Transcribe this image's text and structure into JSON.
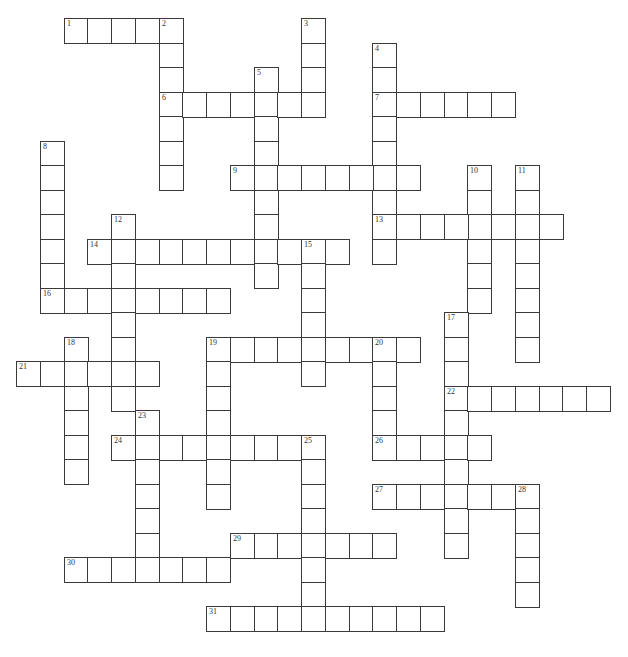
{
  "puzzle": {
    "type": "crossword",
    "layout": {
      "origin_x": 16,
      "origin_y": 18,
      "cell_w": 23.75,
      "cell_h": 24.5
    },
    "colors": {
      "border": "#3a3a3a",
      "fill": "#ffffff",
      "number": "#333333"
    },
    "entries": [
      {
        "number": "1",
        "dir": "across",
        "row": 0,
        "col": 2,
        "length": 5
      },
      {
        "number": "2",
        "dir": "down",
        "row": 0,
        "col": 6,
        "length": 7
      },
      {
        "number": "3",
        "dir": "down",
        "row": 0,
        "col": 12,
        "length": 4
      },
      {
        "number": "4",
        "dir": "down",
        "row": 1,
        "col": 15,
        "length": 9
      },
      {
        "number": "5",
        "dir": "down",
        "row": 2,
        "col": 10,
        "length": 9
      },
      {
        "number": "6",
        "dir": "across",
        "row": 3,
        "col": 6,
        "length": 7
      },
      {
        "number": "7",
        "dir": "across",
        "row": 3,
        "col": 15,
        "length": 6
      },
      {
        "number": "8",
        "dir": "down",
        "row": 5,
        "col": 1,
        "length": 7
      },
      {
        "number": "9",
        "dir": "across",
        "row": 6,
        "col": 9,
        "length": 8
      },
      {
        "number": "10",
        "dir": "down",
        "row": 6,
        "col": 19,
        "length": 6
      },
      {
        "number": "11",
        "dir": "down",
        "row": 6,
        "col": 21,
        "length": 8
      },
      {
        "number": "12",
        "dir": "down",
        "row": 8,
        "col": 4,
        "length": 8
      },
      {
        "number": "13",
        "dir": "across",
        "row": 8,
        "col": 15,
        "length": 8
      },
      {
        "number": "14",
        "dir": "across",
        "row": 9,
        "col": 3,
        "length": 11
      },
      {
        "number": "15",
        "dir": "down",
        "row": 9,
        "col": 12,
        "length": 6
      },
      {
        "number": "16",
        "dir": "across",
        "row": 11,
        "col": 1,
        "length": 8
      },
      {
        "number": "17",
        "dir": "down",
        "row": 12,
        "col": 18,
        "length": 10
      },
      {
        "number": "18",
        "dir": "down",
        "row": 13,
        "col": 2,
        "length": 6
      },
      {
        "number": "19",
        "dir": "across",
        "row": 13,
        "col": 8,
        "length": 9
      },
      {
        "number": "19",
        "dir": "down",
        "row": 13,
        "col": 8,
        "length": 7
      },
      {
        "number": "20",
        "dir": "down",
        "row": 13,
        "col": 15,
        "length": 5
      },
      {
        "number": "21",
        "dir": "across",
        "row": 14,
        "col": 0,
        "length": 6
      },
      {
        "number": "22",
        "dir": "across",
        "row": 15,
        "col": 18,
        "length": 7
      },
      {
        "number": "23",
        "dir": "down",
        "row": 16,
        "col": 5,
        "length": 7
      },
      {
        "number": "24",
        "dir": "across",
        "row": 17,
        "col": 4,
        "length": 9
      },
      {
        "number": "25",
        "dir": "down",
        "row": 17,
        "col": 12,
        "length": 8
      },
      {
        "number": "26",
        "dir": "across",
        "row": 17,
        "col": 15,
        "length": 5
      },
      {
        "number": "27",
        "dir": "across",
        "row": 19,
        "col": 15,
        "length": 7
      },
      {
        "number": "28",
        "dir": "down",
        "row": 19,
        "col": 21,
        "length": 5
      },
      {
        "number": "29",
        "dir": "across",
        "row": 21,
        "col": 9,
        "length": 7
      },
      {
        "number": "30",
        "dir": "across",
        "row": 22,
        "col": 2,
        "length": 7
      },
      {
        "number": "31",
        "dir": "across",
        "row": 24,
        "col": 8,
        "length": 10
      }
    ]
  }
}
